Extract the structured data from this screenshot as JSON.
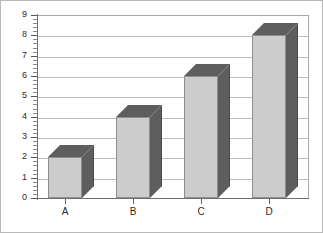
{
  "chart_data": {
    "type": "bar",
    "title": "",
    "subtitle": "",
    "xlabel": "",
    "ylabel": "",
    "categories": [
      "A",
      "B",
      "C",
      "D"
    ],
    "values": [
      2,
      4,
      6,
      8
    ],
    "series": [
      {
        "name": "Series 1",
        "values": [
          2,
          4,
          6,
          8
        ]
      }
    ],
    "ylim": [
      0,
      9
    ],
    "y_major_step": 1,
    "y_minor_step": 0.2,
    "y_tick_labels": [
      "0",
      "1",
      "2",
      "3",
      "4",
      "5",
      "6",
      "7",
      "8",
      "9"
    ],
    "x_tick_labels": [
      "A",
      "B",
      "C",
      "D"
    ],
    "grid": "horizontal",
    "legend": "none",
    "style": "3d-column",
    "colors": {
      "bar_front": "#cccccc",
      "bar_side": "#5e5e5e",
      "bar_top": "#5e5e5e",
      "bar_outline": "#8e8e8e",
      "gridline": "#bdbdbd",
      "axis": "#6f6f6f",
      "frame": "#a8a8a8",
      "background": "#ffffff",
      "text": "#2b2b2b"
    },
    "annotations": []
  }
}
